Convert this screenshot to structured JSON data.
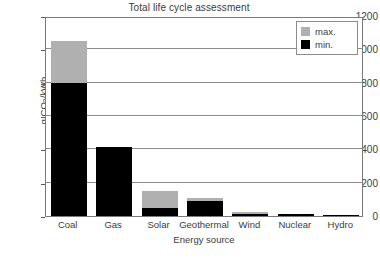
{
  "chart_data": {
    "type": "bar",
    "title": "Total life cycle assessment",
    "xlabel": "Energy source",
    "ylabel": "g CO2/kWh",
    "ylabel_parts": {
      "prefix": "g CO",
      "sub": "2",
      "suffix": "/kWh"
    },
    "categories": [
      "Coal",
      "Gas",
      "Solar",
      "Geothermal",
      "Wind",
      "Nuclear",
      "Hydro"
    ],
    "series": [
      {
        "name": "max.",
        "color": "#b0b0b0",
        "values": [
          1050,
          415,
          150,
          110,
          25,
          15,
          5
        ]
      },
      {
        "name": "min.",
        "color": "#000000",
        "values": [
          800,
          415,
          50,
          90,
          10,
          10,
          2
        ]
      }
    ],
    "ylim": [
      0,
      1200
    ],
    "yticks": [
      0,
      200,
      400,
      600,
      800,
      1000,
      1200
    ],
    "ytick_labels": [
      "0",
      "200",
      "400",
      "600",
      "800",
      "1000",
      "1200"
    ],
    "grid": true,
    "grid_axis": "y",
    "legend_position": "top-right",
    "stacked_overlay": true
  },
  "legend": {
    "entries": [
      {
        "label": "max.",
        "swatch": "max"
      },
      {
        "label": "min.",
        "swatch": "min"
      }
    ]
  },
  "colors": {
    "max_series": "#b0b0b0",
    "min_series": "#000000",
    "axis": "#7a7a7a",
    "grid": "#8c8c8c",
    "text": "#3b3b3b",
    "background": "#ffffff"
  }
}
